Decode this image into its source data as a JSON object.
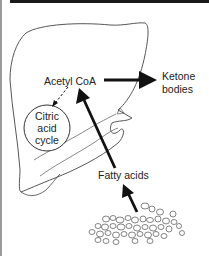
{
  "diagram": {
    "nodes": {
      "acetyl_coa": "Acetyl CoA",
      "ketone_bodies_line1": "Ketone",
      "ketone_bodies_line2": "bodies",
      "citric_line1": "Citric",
      "citric_line2": "acid",
      "citric_line3": "cycle",
      "fatty_acids": "Fatty acids"
    },
    "edges": [
      {
        "from": "Fatty acids (adipose tissue)",
        "to": "Fatty acids",
        "style": "solid-bold"
      },
      {
        "from": "Fatty acids",
        "to": "Acetyl CoA",
        "style": "solid-bold"
      },
      {
        "from": "Acetyl CoA",
        "to": "Ketone bodies",
        "style": "solid-bold"
      },
      {
        "from": "Acetyl CoA",
        "to": "Citric acid cycle",
        "style": "dashed"
      }
    ],
    "colors": {
      "ink": "#1a1a1a",
      "outline": "#444444",
      "background": "#ffffff"
    }
  }
}
